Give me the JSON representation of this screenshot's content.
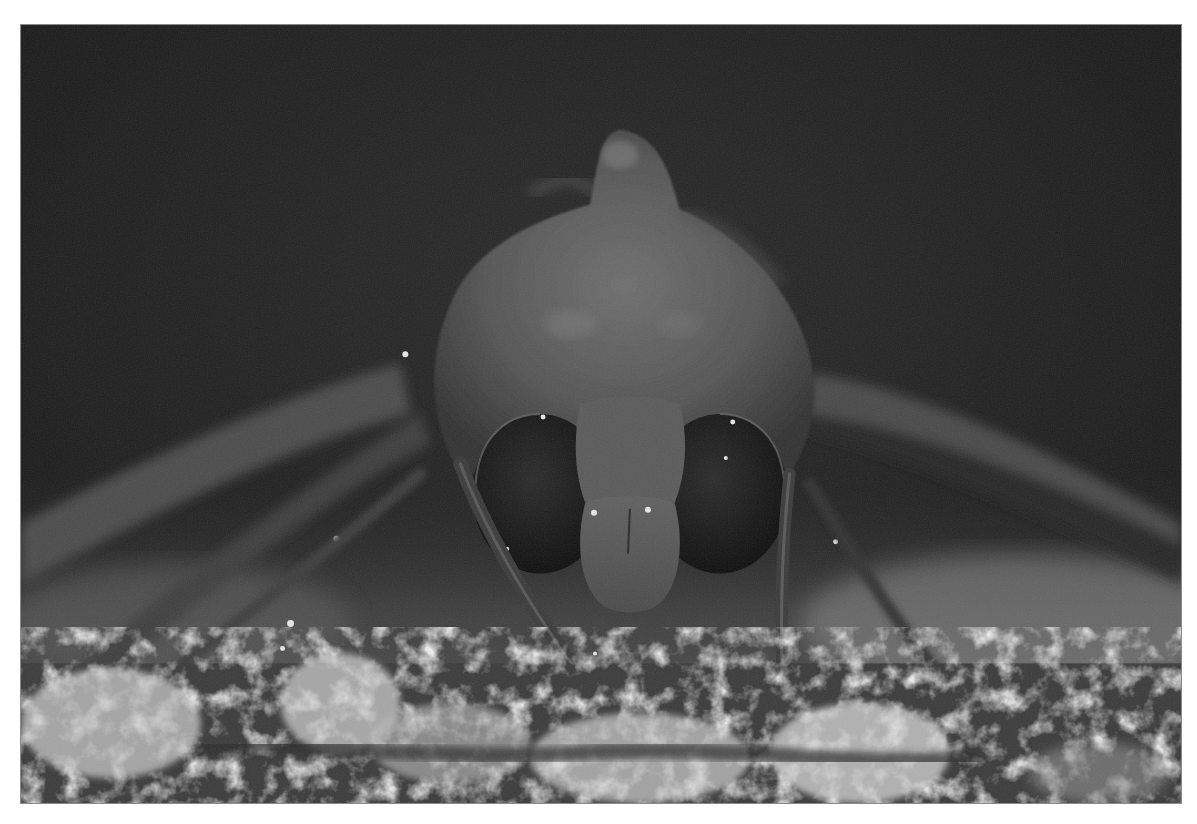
{
  "image": {
    "subject": "moth",
    "description": "Black-and-white macro photograph of a moth facing the camera, perched on lichen-covered bark",
    "style": "monochrome",
    "colors": {
      "page_background": "#ffffff",
      "frame_border": "#8a8a8a",
      "background_dark": "#1c1c1c",
      "moth_body": "#5a5a5a",
      "eyes": "#151515",
      "lichen_highlight": "#d8d8d8"
    }
  }
}
